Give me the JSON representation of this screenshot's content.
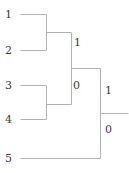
{
  "figure": {
    "type": "dendrogram-binary-tree",
    "width": 129,
    "height": 173,
    "background_color": "#ffffff",
    "line_color": "#b4b4b4",
    "text_color": "#3a3a3a",
    "line_width": 1
  },
  "leaves": [
    {
      "id": "leaf-1",
      "label": "1",
      "label_x": 5,
      "label_y": 9,
      "line_y": 14,
      "line_x1": 20,
      "line_x2": 46
    },
    {
      "id": "leaf-2",
      "label": "2",
      "label_x": 5,
      "label_y": 45,
      "line_y": 50,
      "line_x1": 20,
      "line_x2": 46
    },
    {
      "id": "leaf-3",
      "label": "3",
      "label_x": 5,
      "label_y": 80,
      "line_y": 85,
      "line_x1": 20,
      "line_x2": 46
    },
    {
      "id": "leaf-4",
      "label": "4",
      "label_x": 5,
      "label_y": 114,
      "line_y": 119,
      "line_x1": 20,
      "line_x2": 46
    },
    {
      "id": "leaf-5",
      "label": "5",
      "label_x": 5,
      "label_y": 153,
      "line_y": 158,
      "line_x1": 20,
      "line_x2": 100
    }
  ],
  "internal_nodes": [
    {
      "id": "node-a",
      "description": "merge of leaf 1 and leaf 2",
      "stem_x": 46,
      "stem_y1": 14,
      "stem_y2": 50,
      "out_y": 32,
      "out_x2": 71,
      "label": "1",
      "label_x": 74,
      "label_y": 37
    },
    {
      "id": "node-b",
      "description": "merge of leaf 3 and leaf 4",
      "stem_x": 46,
      "stem_y1": 85,
      "stem_y2": 119,
      "out_y": 104,
      "out_x2": 71,
      "label": "",
      "label_x": 0,
      "label_y": 0
    },
    {
      "id": "node-c",
      "description": "merge of node-a and node-b",
      "stem_x": 71,
      "stem_y1": 32,
      "stem_y2": 104,
      "out_y": 68,
      "out_x2": 100,
      "label": "0",
      "label_x": 73,
      "label_y": 80
    },
    {
      "id": "node-root",
      "description": "merge of node-c and leaf 5 (root)",
      "stem_x": 100,
      "stem_y1": 68,
      "stem_y2": 158,
      "out_y": 113,
      "out_x2": 128,
      "label_upper": "1",
      "label_upper_x": 105,
      "label_upper_y": 85,
      "label_lower": "0",
      "label_lower_x": 105,
      "label_lower_y": 124
    }
  ],
  "edge_labels": [
    {
      "id": "edge-label-node-a",
      "text": "1"
    },
    {
      "id": "edge-label-node-c",
      "text": "0"
    },
    {
      "id": "edge-label-root-upper",
      "text": "1"
    },
    {
      "id": "edge-label-root-lower",
      "text": "0"
    }
  ]
}
